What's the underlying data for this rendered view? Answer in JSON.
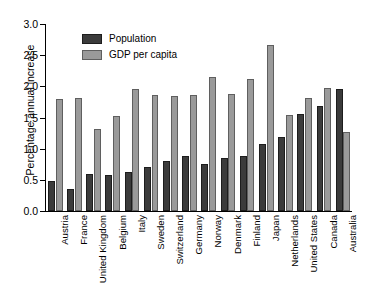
{
  "chart_data": {
    "type": "bar",
    "title": "",
    "xlabel": "",
    "ylabel": "Percentage annual increase",
    "ylim": [
      0.0,
      3.0
    ],
    "ytick_labels": [
      "0.0",
      "0.5",
      "1.0",
      "1.5",
      "2.0",
      "2.5",
      "3.0"
    ],
    "ytick_values": [
      0.0,
      0.5,
      1.0,
      1.5,
      2.0,
      2.5,
      3.0
    ],
    "grid": false,
    "legend_position": "top-left-inside",
    "categories": [
      "Austria",
      "France",
      "United Kingdom",
      "Belgium",
      "Italy",
      "Sweden",
      "Switzerland",
      "Germany",
      "Norway",
      "Denmark",
      "Finland",
      "Japan",
      "Netherlands",
      "United States",
      "Canada",
      "Australia"
    ],
    "series": [
      {
        "name": "Population",
        "color": "#3b3b3b",
        "values": [
          0.48,
          0.36,
          0.59,
          0.58,
          0.62,
          0.71,
          0.8,
          0.89,
          0.76,
          0.85,
          0.88,
          1.07,
          1.18,
          1.55,
          1.69,
          1.96
        ]
      },
      {
        "name": "GDP per capita",
        "color": "#9a9a9a",
        "values": [
          1.8,
          1.82,
          1.31,
          1.53,
          1.95,
          1.86,
          1.84,
          1.86,
          2.15,
          1.88,
          2.12,
          2.67,
          1.54,
          1.81,
          1.97,
          1.26
        ]
      }
    ]
  }
}
